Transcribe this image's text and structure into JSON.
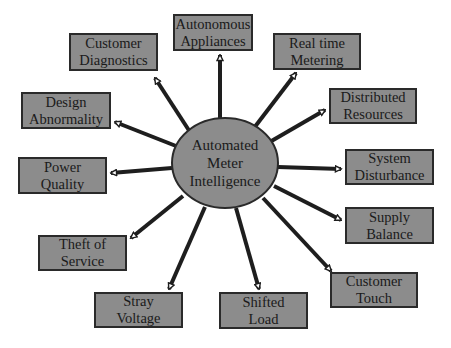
{
  "diagram": {
    "type": "hub-and-spoke",
    "center": {
      "lines": [
        "Automated",
        "Meter",
        "Intelligence"
      ],
      "fill": "#8c8c8c"
    },
    "nodes": [
      {
        "id": "autonomous-appliances",
        "lines": [
          "Autonomous",
          "Appliances"
        ]
      },
      {
        "id": "customer-diagnostics",
        "lines": [
          "Customer",
          "Diagnostics"
        ]
      },
      {
        "id": "real-time-metering",
        "lines": [
          "Real time",
          "Metering"
        ]
      },
      {
        "id": "design-abnormality",
        "lines": [
          "Design",
          "Abnormality"
        ]
      },
      {
        "id": "distributed-resources",
        "lines": [
          "Distributed",
          "Resources"
        ]
      },
      {
        "id": "power-quality",
        "lines": [
          "Power",
          "Quality"
        ]
      },
      {
        "id": "system-disturbance",
        "lines": [
          "System",
          "Disturbance"
        ]
      },
      {
        "id": "supply-balance",
        "lines": [
          "Supply",
          "Balance"
        ]
      },
      {
        "id": "theft-of-service",
        "lines": [
          "Theft of",
          "Service"
        ]
      },
      {
        "id": "customer-touch",
        "lines": [
          "Customer",
          "Touch"
        ]
      },
      {
        "id": "stray-voltage",
        "lines": [
          "Stray",
          "Voltage"
        ]
      },
      {
        "id": "shifted-load",
        "lines": [
          "Shifted",
          "Load"
        ]
      }
    ],
    "colors": {
      "box_fill": "#8c8c8c",
      "border": "#2a2a2a",
      "arrow": "#1e1e1e",
      "background": "#ffffff"
    }
  }
}
